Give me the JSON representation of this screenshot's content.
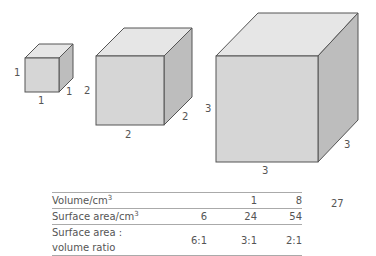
{
  "cubes": [
    {
      "name": "cube-1",
      "side": 1,
      "labels": {
        "height": "1",
        "width": "1",
        "depth": "1"
      }
    },
    {
      "name": "cube-2",
      "side": 2,
      "labels": {
        "height": "2",
        "width": "2",
        "depth": "2"
      }
    },
    {
      "name": "cube-3",
      "side": 3,
      "labels": {
        "height": "3",
        "width": "3",
        "depth": "3"
      }
    }
  ],
  "colors": {
    "front": "#d6d6d6",
    "top": "#e6e6e6",
    "side": "#bdbdbd",
    "edge": "#555555"
  },
  "table": {
    "rows": [
      {
        "label": "Volume/cm",
        "sup": "3",
        "values": [
          "",
          "1",
          "8"
        ]
      },
      {
        "label": "Surface area/cm",
        "sup": "3",
        "values": [
          "6",
          "24",
          "54"
        ]
      },
      {
        "label": "Surface area : volume ratio",
        "sup": "",
        "values": [
          "6:1",
          "3:1",
          "2:1"
        ]
      }
    ],
    "overflow_value": "27"
  }
}
